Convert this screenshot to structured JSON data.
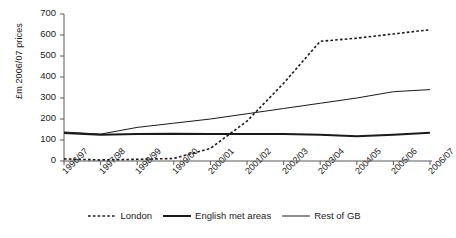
{
  "chart_data": {
    "type": "line",
    "title": "",
    "xlabel": "",
    "ylabel": "£m 2006/07 prices",
    "ylim": [
      0,
      700
    ],
    "yticks": [
      0,
      100,
      200,
      300,
      400,
      500,
      600,
      700
    ],
    "grid": false,
    "legend_position": "bottom",
    "categories": [
      "1996/97",
      "1997/98",
      "1998/99",
      "1999/00",
      "2000/01",
      "2001/02",
      "2002/03",
      "2003/04",
      "2004/05",
      "2005/06",
      "2006/07"
    ],
    "series": [
      {
        "name": "London",
        "style": "dashed",
        "values": [
          10,
          5,
          8,
          12,
          60,
          190,
          370,
          570,
          585,
          605,
          625
        ]
      },
      {
        "name": "English met areas",
        "style": "solid-thick",
        "values": [
          133,
          125,
          128,
          130,
          128,
          128,
          128,
          125,
          118,
          125,
          135
        ]
      },
      {
        "name": "Rest of GB",
        "style": "solid-thin",
        "values": [
          138,
          128,
          160,
          180,
          200,
          225,
          250,
          275,
          300,
          330,
          340
        ]
      }
    ]
  },
  "legend": {
    "entries": [
      {
        "label": "London"
      },
      {
        "label": "English met areas"
      },
      {
        "label": "Rest of GB"
      }
    ]
  },
  "axis": {
    "y_label": "£m 2006/07 prices",
    "y_tick_labels": [
      "700",
      "600",
      "500",
      "400",
      "300",
      "200",
      "100",
      "0"
    ],
    "x_tick_labels": [
      "1996/97",
      "1997/98",
      "1998/99",
      "1999/00",
      "2000/01",
      "2001/02",
      "2002/03",
      "2003/04",
      "2004/05",
      "2005/06",
      "2006/07"
    ]
  },
  "colors": {
    "axis": "#5a5a5a",
    "line": "#1a1a1a",
    "background": "#ffffff"
  }
}
